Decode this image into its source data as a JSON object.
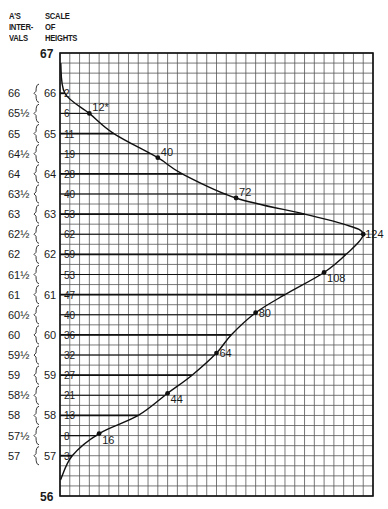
{
  "header": {
    "left": [
      "A'S",
      "INTER-",
      "VALS"
    ],
    "right": [
      "SCALE",
      "OF",
      "HEIGHTS"
    ]
  },
  "axis": {
    "top_label": "67",
    "bottom_label": "56"
  },
  "chart_data": {
    "type": "line",
    "title": "",
    "xlabel": "",
    "ylabel": "Scale of Heights",
    "ylim": [
      56,
      67
    ],
    "xlim": [
      0,
      128
    ],
    "grid": true,
    "intervals": [
      {
        "interval": "66",
        "height": 66,
        "value": 2
      },
      {
        "interval": "65½",
        "height": 65.5,
        "value": 6
      },
      {
        "interval": "65",
        "height": 65,
        "value": 11
      },
      {
        "interval": "64½",
        "height": 64.5,
        "value": 19
      },
      {
        "interval": "64",
        "height": 64,
        "value": 28
      },
      {
        "interval": "63½",
        "height": 63.5,
        "value": 40
      },
      {
        "interval": "63",
        "height": 63,
        "value": 53
      },
      {
        "interval": "62½",
        "height": 62.5,
        "value": 62
      },
      {
        "interval": "62",
        "height": 62,
        "value": 59
      },
      {
        "interval": "61½",
        "height": 61.5,
        "value": 53
      },
      {
        "interval": "61",
        "height": 61,
        "value": 47
      },
      {
        "interval": "60½",
        "height": 60.5,
        "value": 40
      },
      {
        "interval": "60",
        "height": 60,
        "value": 36
      },
      {
        "interval": "59½",
        "height": 59.5,
        "value": 32
      },
      {
        "interval": "59",
        "height": 59,
        "value": 27
      },
      {
        "interval": "58½",
        "height": 58.5,
        "value": 21
      },
      {
        "interval": "58",
        "height": 58,
        "value": 13
      },
      {
        "interval": "57½",
        "height": 57.5,
        "value": 8
      },
      {
        "interval": "57",
        "height": 57,
        "value": 3
      }
    ],
    "scale_ticks": [
      "66",
      "65",
      "64",
      "63",
      "62",
      "61",
      "60",
      "59",
      "58",
      "57"
    ],
    "marked_points": [
      {
        "height": 65.5,
        "x": 12,
        "label": "12*"
      },
      {
        "height": 64.4,
        "x": 40,
        "label": "40"
      },
      {
        "height": 63.4,
        "x": 72,
        "label": "72"
      },
      {
        "height": 62.5,
        "x": 124,
        "label": "124"
      },
      {
        "height": 61.55,
        "x": 108,
        "label": "108"
      },
      {
        "height": 60.55,
        "x": 80,
        "label": "80"
      },
      {
        "height": 59.55,
        "x": 64,
        "label": "64"
      },
      {
        "height": 58.55,
        "x": 44,
        "label": "44"
      },
      {
        "height": 57.55,
        "x": 16,
        "label": "16"
      }
    ]
  }
}
